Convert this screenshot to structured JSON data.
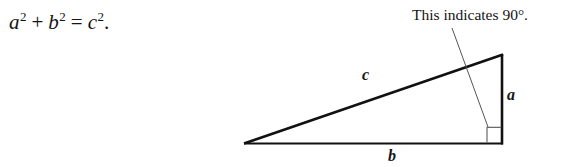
{
  "figure": {
    "caption_equation": {
      "full_text": "a2 + b2 = c2.",
      "term_a": "a",
      "exp_a": "2",
      "plus": "+",
      "term_b": "b",
      "exp_b": "2",
      "equals": "=",
      "term_c": "c",
      "exp_c": "2",
      "period": "."
    },
    "annotation": {
      "text": "This indicates 90°."
    },
    "labels": {
      "hypotenuse": "c",
      "vertical_leg": "a",
      "horizontal_leg": "b"
    },
    "colors": {
      "background": "#ffffff",
      "ink": "#141414",
      "stroke": "#111111",
      "leader": "#555555",
      "right_angle_mark": "#6a6a6a"
    },
    "geometry": {
      "left_vertex": [
        244,
        144
      ],
      "apex_vertex": [
        503,
        54
      ],
      "right_vertex": [
        502,
        144
      ],
      "right_angle_square": [
        487,
        127,
        15,
        16
      ],
      "leader_start": [
        452,
        28
      ],
      "leader_end": [
        488,
        128
      ]
    }
  }
}
